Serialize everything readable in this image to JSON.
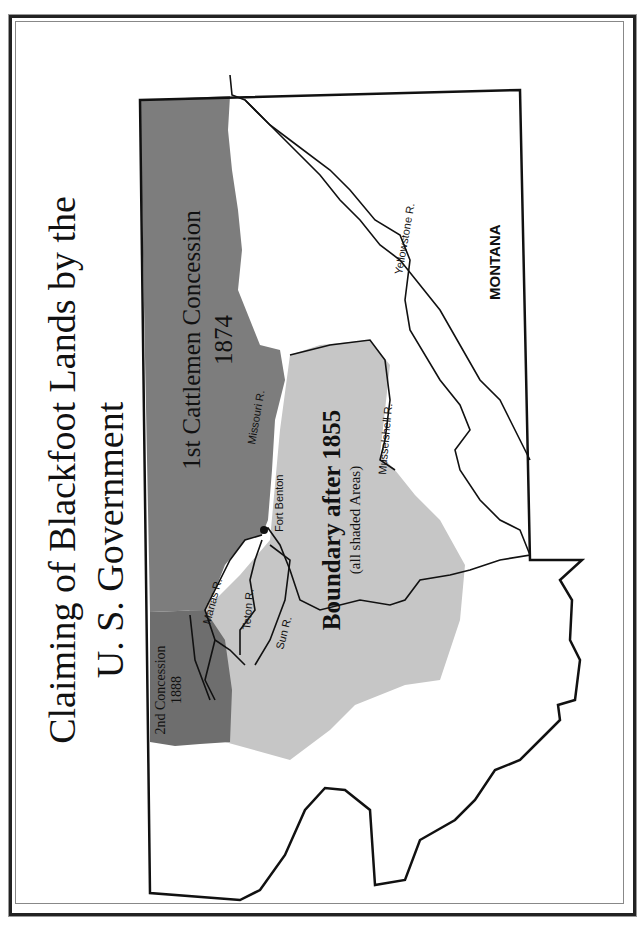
{
  "page": {
    "title_line1": "Claiming of Blackfoot Lands by the",
    "title_line2": "U. S. Government",
    "orientation": "rotated 90° counter-clockwise (landscape page)"
  },
  "map": {
    "state_label": "MONTANA",
    "colors": {
      "first_concession": "#7d7d7d",
      "second_concession": "#6e6e6e",
      "boundary_1855": "#c6c6c6",
      "outline": "#111111",
      "background": "#ffffff"
    },
    "regions": [
      {
        "id": "first-concession",
        "label": "1st Cattlemen Concession",
        "year": "1874"
      },
      {
        "id": "second-concession",
        "label": "2nd Concession",
        "year": "1888"
      },
      {
        "id": "boundary-1855",
        "label": "Boundary after 1855",
        "sublabel": "(all shaded Areas)"
      }
    ],
    "rivers": [
      {
        "id": "missouri",
        "label": "Missouri R."
      },
      {
        "id": "marias",
        "label": "Marias R."
      },
      {
        "id": "teton",
        "label": "Teton R."
      },
      {
        "id": "sun",
        "label": "Sun R."
      },
      {
        "id": "musselshell",
        "label": "Musselshell R."
      },
      {
        "id": "yellowstone",
        "label": "Yellowstone R."
      }
    ],
    "places": [
      {
        "id": "fort-benton",
        "label": "Fort Benton"
      }
    ]
  }
}
